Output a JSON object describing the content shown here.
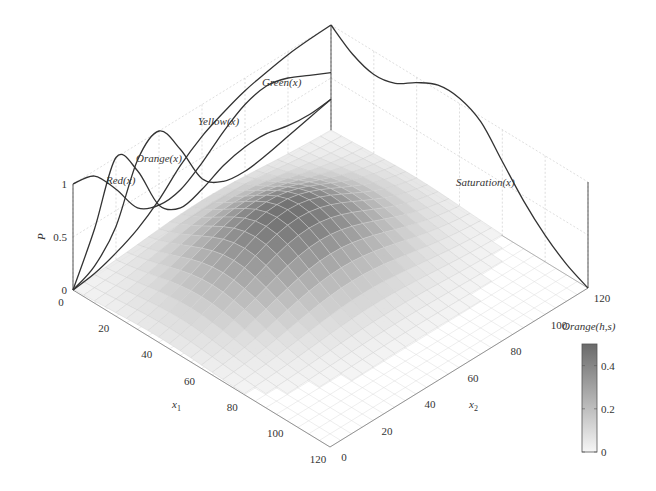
{
  "chart_data": {
    "type": "surface3d",
    "title": "",
    "xlabel": "x1",
    "ylabel": "x2",
    "zlabel": "P",
    "x_ticks": [
      0,
      20,
      40,
      60,
      80,
      100,
      120
    ],
    "y_ticks": [
      0,
      20,
      40,
      60,
      80,
      100,
      120
    ],
    "z_ticks": [
      0,
      0.5,
      1
    ],
    "xlim": [
      0,
      120
    ],
    "ylim": [
      0,
      120
    ],
    "zlim": [
      0,
      1
    ],
    "grid": true,
    "surface": {
      "name": "Orange(h,s)",
      "description": "Grayscale surface with a single rounded hump; peak ~0.5 near x1≈40, x2≈60, near zero elsewhere",
      "peak": {
        "x1": 40,
        "x2": 60,
        "value": 0.5
      },
      "spread": {
        "x1": 22,
        "x2": 28
      }
    },
    "colorbar": {
      "label": "Orange(h,s)",
      "ticks": [
        0,
        0.2,
        0.4
      ],
      "range": [
        0,
        0.5
      ],
      "colors": [
        "#f4f4f4",
        "#6e6e6e"
      ]
    },
    "wall_curves_x2_plane": {
      "axis": "x2",
      "x": [
        0,
        10,
        20,
        30,
        40,
        50,
        60,
        70,
        80,
        90,
        100,
        110,
        120
      ],
      "series": [
        {
          "name": "Red(x)",
          "values": [
            1.0,
            0.95,
            0.7,
            0.4,
            0.3,
            0.32,
            0.45,
            0.62,
            0.75,
            0.8,
            0.75,
            0.65,
            0.55
          ]
        },
        {
          "name": "Orange(x)",
          "values": [
            0.0,
            0.45,
            1.0,
            0.75,
            0.3,
            0.15,
            0.2,
            0.3,
            0.35,
            0.35,
            0.3,
            0.28,
            0.3
          ]
        },
        {
          "name": "Yellow(x)",
          "values": [
            0.0,
            0.1,
            0.35,
            0.85,
            1.0,
            0.7,
            0.3,
            0.15,
            0.12,
            0.15,
            0.2,
            0.25,
            0.3
          ]
        },
        {
          "name": "Green(x)",
          "values": [
            0.0,
            0.03,
            0.1,
            0.2,
            0.35,
            0.55,
            0.7,
            0.8,
            0.88,
            0.93,
            0.97,
            0.99,
            1.0
          ]
        }
      ]
    },
    "wall_curves_x1_plane": {
      "axis": "x1",
      "x": [
        0,
        10,
        20,
        30,
        40,
        50,
        60,
        70,
        80,
        90,
        100,
        110,
        120
      ],
      "series": [
        {
          "name": "Saturation(x)",
          "values": [
            0.0,
            -0.15,
            -0.22,
            -0.18,
            -0.05,
            0.05,
            0.05,
            -0.05,
            -0.3,
            -0.55,
            -0.75,
            -0.9,
            -1.0
          ]
        }
      ]
    },
    "labels": {
      "p_axis": "P",
      "x1_axis": "x",
      "x1_sub": "1",
      "x2_axis": "x",
      "x2_sub": "2",
      "colorbar_title": "Orange(h,s)",
      "red": "Red(x)",
      "orange": "Orange(x)",
      "yellow": "Yellow(x)",
      "green": "Green(x)",
      "saturation": "Saturation(x)"
    }
  }
}
